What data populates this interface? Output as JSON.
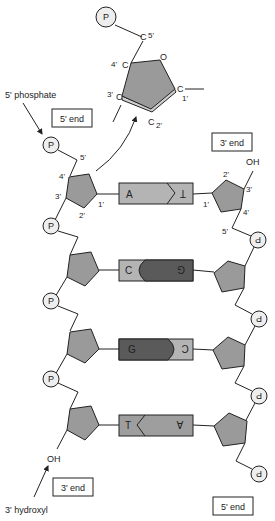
{
  "colors": {
    "sugar": "#9a9a9a",
    "phosphate": "#eeeeee",
    "purine_light": "#b4b4b4",
    "pyrimidine_dark": "#5a5a5a",
    "outline": "#222222"
  },
  "inset": {
    "phosphate": "P",
    "c5": "C",
    "c5_label": "5'",
    "c4": "C",
    "c4_label": "4'",
    "oxygen": "O",
    "c3": "C",
    "c3_label": "3'",
    "c2": "C",
    "c2_label": "2'",
    "c1": "C",
    "c1_label": "1'"
  },
  "annotations": {
    "five_phosphate": "5' phosphate",
    "three_hydroxyl": "3' hydroxyl",
    "five_end_left": "5' end",
    "three_end_right": "3' end",
    "three_end_left": "3' end",
    "five_end_right": "5' end",
    "oh_top": "OH",
    "oh_bottom": "OH"
  },
  "left_strand": {
    "phosphate_label": "P",
    "atoms": {
      "c5": "5'",
      "c4": "4'",
      "c3": "3'",
      "c2": "2'",
      "c1": "1'"
    }
  },
  "right_strand": {
    "phosphate_label": "P",
    "atoms": {
      "c2": "2'",
      "c3": "3'",
      "c4": "4'",
      "c5": "5'",
      "c1": "1'"
    }
  },
  "base_pairs": [
    {
      "left": "A",
      "right": "T"
    },
    {
      "left": "C",
      "right": "G"
    },
    {
      "left": "G",
      "right": "C"
    },
    {
      "left": "T",
      "right": "A"
    }
  ]
}
